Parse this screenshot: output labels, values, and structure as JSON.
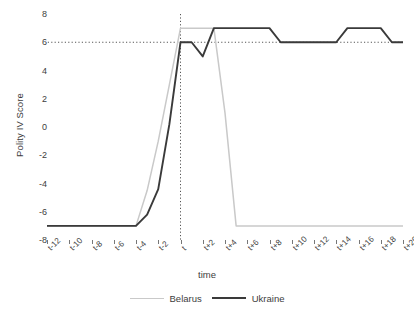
{
  "chart_data": {
    "type": "line",
    "title": "",
    "xlabel": "time",
    "ylabel": "Polity IV Score",
    "x": [
      "t-12",
      "t-11",
      "t-10",
      "t-9",
      "t-8",
      "t-7",
      "t-6",
      "t-5",
      "t-4",
      "t-3",
      "t-2",
      "t-1",
      "t",
      "t+1",
      "t+2",
      "t+3",
      "t+4",
      "t+5",
      "t+6",
      "t+7",
      "t+8",
      "t+9",
      "t+10",
      "t+11",
      "t+12",
      "t+13",
      "t+14",
      "t+15",
      "t+16",
      "t+17",
      "t+18",
      "t+19",
      "t+20"
    ],
    "tick_labels": [
      "t-12",
      "t-10",
      "t-8",
      "t-6",
      "t-4",
      "t-2",
      "t",
      "t+2",
      "t+4",
      "t+6",
      "t+8",
      "t+10",
      "t+12",
      "t+14",
      "t+16",
      "t+18",
      "t+20"
    ],
    "ytick_labels": [
      "8",
      "6",
      "4",
      "2",
      "0",
      "-2",
      "-4",
      "-6",
      "-8"
    ],
    "ytick_values": [
      8,
      6,
      4,
      2,
      0,
      -2,
      -4,
      -6,
      -8
    ],
    "ylim": [
      -8,
      8
    ],
    "xlim": [
      -12,
      20
    ],
    "grid": false,
    "legend_position": "bottom",
    "reference_line_y": 6,
    "reference_line_x": "t",
    "series": [
      {
        "name": "Belarus",
        "color": "#c9c9c9",
        "values": [
          -7,
          -7,
          -7,
          -7,
          -7,
          -7,
          -7,
          -7,
          -7,
          -4.5,
          -1,
          3,
          7,
          7,
          7,
          7,
          1,
          -7,
          -7,
          -7,
          -7,
          -7,
          -7,
          -7,
          -7,
          -7,
          -7,
          -7,
          -7,
          -7,
          -7,
          -7,
          -7
        ]
      },
      {
        "name": "Ukraine",
        "color": "#3a3a3a",
        "values": [
          -7,
          -7,
          -7,
          -7,
          -7,
          -7,
          -7,
          -7,
          -7,
          -6.2,
          -4.4,
          0.2,
          6,
          6,
          5,
          7,
          7,
          7,
          7,
          7,
          7,
          6,
          6,
          6,
          6,
          6,
          6,
          7,
          7,
          7,
          7,
          6,
          6
        ]
      }
    ]
  },
  "legend": {
    "items": [
      {
        "label": "Belarus",
        "swatch": "belarus-line-swatch"
      },
      {
        "label": "Ukraine",
        "swatch": "ukraine-line-swatch"
      }
    ]
  }
}
